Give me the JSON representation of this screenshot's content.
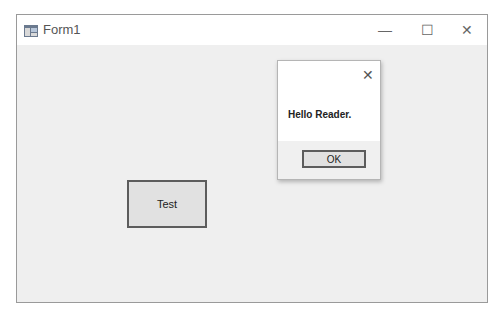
{
  "window": {
    "title": "Form1",
    "icon": "form-app-icon",
    "controls": {
      "minimize": "—",
      "maximize": "☐",
      "close": "✕"
    }
  },
  "form": {
    "test_button_label": "Test"
  },
  "message_box": {
    "close_glyph": "✕",
    "text": "Hello Reader.",
    "ok_label": "OK"
  }
}
